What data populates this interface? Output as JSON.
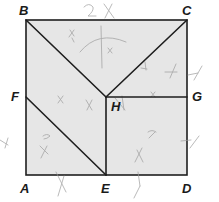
{
  "figure": {
    "type": "square-dissection",
    "fill_color": "#e6e6e6",
    "line_color": "#1e1e1e",
    "pencil_color": "#9a9a9a",
    "points": {
      "A": {
        "label": "A",
        "x": 26,
        "y": 175
      },
      "B": {
        "label": "B",
        "x": 26,
        "y": 20
      },
      "C": {
        "label": "C",
        "x": 187,
        "y": 20
      },
      "D": {
        "label": "D",
        "x": 187,
        "y": 175
      },
      "E": {
        "label": "E",
        "x": 106,
        "y": 175
      },
      "F": {
        "label": "F",
        "x": 26,
        "y": 97
      },
      "G": {
        "label": "G",
        "x": 187,
        "y": 97
      },
      "H": {
        "label": "H",
        "x": 106,
        "y": 97
      }
    },
    "segments": [
      [
        "A",
        "B"
      ],
      [
        "B",
        "C"
      ],
      [
        "C",
        "D"
      ],
      [
        "D",
        "A"
      ],
      [
        "B",
        "H"
      ],
      [
        "C",
        "H"
      ],
      [
        "H",
        "G"
      ],
      [
        "H",
        "E"
      ],
      [
        "F",
        "E"
      ]
    ],
    "labels": {
      "A": "A",
      "B": "B",
      "C": "C",
      "D": "D",
      "E": "E",
      "F": "F",
      "G": "G",
      "H": "H"
    },
    "annotations": {
      "top_handwriting": "2x",
      "region_marks": [
        "x",
        "x",
        "x",
        "x",
        "x",
        "x"
      ]
    }
  }
}
